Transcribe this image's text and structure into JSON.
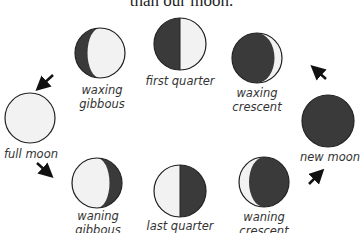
{
  "header": {
    "text": "than our moon."
  },
  "phases": [
    {
      "id": "waxing-gibbous",
      "label_lines": [
        "waxing",
        "gibbous"
      ],
      "lit_fraction": 0.75,
      "lit_side": "right"
    },
    {
      "id": "first-quarter",
      "label_lines": [
        "first quarter"
      ],
      "lit_fraction": 0.5,
      "lit_side": "right"
    },
    {
      "id": "waxing-crescent",
      "label_lines": [
        "waxing",
        "crescent"
      ],
      "lit_fraction": 0.15,
      "lit_side": "right"
    },
    {
      "id": "full-moon",
      "label_lines": [
        "full moon"
      ],
      "lit_fraction": 1.0,
      "lit_side": "both"
    },
    {
      "id": "new-moon",
      "label_lines": [
        "new moon"
      ],
      "lit_fraction": 0.0,
      "lit_side": "none"
    },
    {
      "id": "waning-gibbous",
      "label_lines": [
        "waning",
        "gibbous"
      ],
      "lit_fraction": 0.75,
      "lit_side": "left"
    },
    {
      "id": "last-quarter",
      "label_lines": [
        "last quarter"
      ],
      "lit_fraction": 0.5,
      "lit_side": "left"
    },
    {
      "id": "waning-crescent",
      "label_lines": [
        "waning",
        "crescent"
      ],
      "lit_fraction": 0.2,
      "lit_side": "left"
    }
  ],
  "arrows": [
    {
      "id": "arrow-new-to-waxing-crescent",
      "direction": "up-left"
    },
    {
      "id": "arrow-waxing-gibbous-to-full",
      "direction": "down-left"
    },
    {
      "id": "arrow-full-to-waning-gibbous",
      "direction": "down-right"
    },
    {
      "id": "arrow-waning-crescent-to-new",
      "direction": "up-right"
    }
  ],
  "colors": {
    "dark": "#3a3a3a",
    "light": "#f2f2f2",
    "outline": "#222222",
    "text": "#333333"
  }
}
